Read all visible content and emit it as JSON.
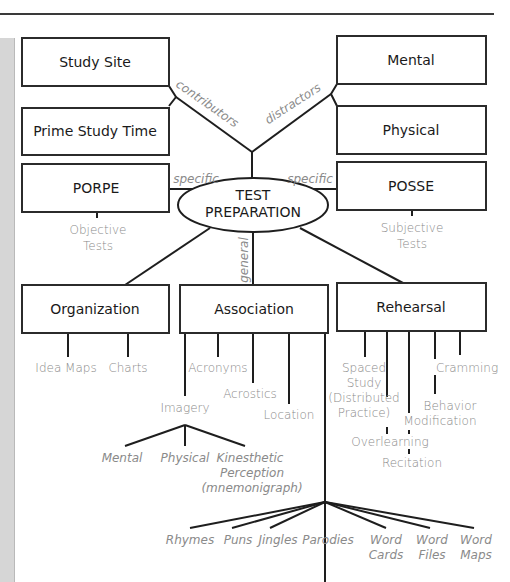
{
  "diagram": {
    "center": {
      "line1": "TEST",
      "line2": "PREPARATION"
    },
    "top_left_boxes": [
      {
        "label": "Study Site"
      },
      {
        "label": "Prime Study Time"
      }
    ],
    "top_right_boxes": [
      {
        "label": "Mental"
      },
      {
        "label": "Physical"
      }
    ],
    "edge_labels": {
      "contributors": "contributors",
      "distractors": "distractors",
      "specific_left": "specific",
      "specific_right": "specific",
      "general": "general"
    },
    "porpe": {
      "label": "PORPE",
      "sub1": "Objective",
      "sub2": "Tests"
    },
    "posse": {
      "label": "POSSE",
      "sub1": "Subjective",
      "sub2": "Tests"
    },
    "organization": {
      "label": "Organization",
      "children": [
        "Idea Maps",
        "Charts"
      ]
    },
    "association": {
      "label": "Association",
      "children": [
        "Acronyms",
        "Acrostics",
        "Location",
        "Imagery"
      ],
      "imagery_children": [
        "Mental",
        "Physical",
        "Kinesthetic",
        "Perception",
        "(mnemonigraph)"
      ],
      "verbal_children": [
        "Rhymes",
        "Puns",
        "Jingles",
        "Parodies",
        "Word",
        "Cards",
        "Word",
        "Files",
        "Word",
        "Maps"
      ]
    },
    "rehearsal": {
      "label": "Rehearsal",
      "spaced": [
        "Spaced",
        "Study",
        "(Distributed",
        "Practice)"
      ],
      "cramming": "Cramming",
      "behavior": [
        "Behavior",
        "Modification"
      ],
      "overlearning": "Overlearning",
      "recitation": "Recitation"
    }
  },
  "colors": {
    "line": "#1e1e1e",
    "label_gray": "#8a8a8a",
    "sidebar": "#d6d6d6"
  }
}
